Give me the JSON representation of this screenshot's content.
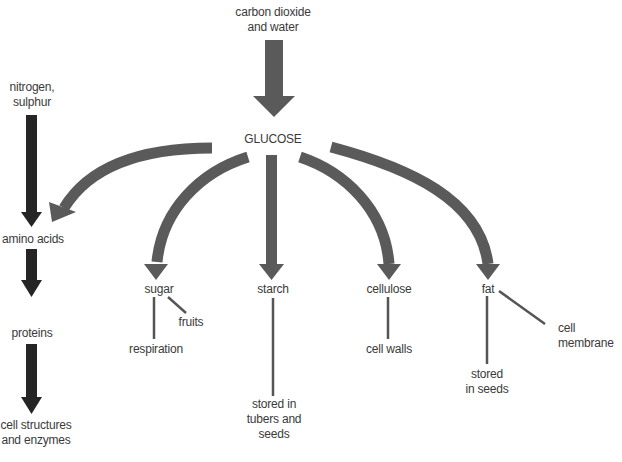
{
  "diagram": {
    "colors": {
      "background": "#ffffff",
      "grey_arrow": "#5a5a5a",
      "dark_arrow": "#252525",
      "line": "#555555",
      "text": "#3a3a3a"
    },
    "nodes": {
      "source": {
        "line1": "carbon dioxide",
        "line2": "and water"
      },
      "glucose": {
        "label": "GLUCOSE"
      },
      "minerals": {
        "line1": "nitrogen,",
        "line2": "sulphur"
      },
      "amino_acids": {
        "label": "amino acids"
      },
      "proteins": {
        "label": "proteins"
      },
      "cell_structures": {
        "line1": "cell structures",
        "line2": "and enzymes"
      },
      "sugar": {
        "label": "sugar"
      },
      "fruits": {
        "label": "fruits"
      },
      "respiration": {
        "label": "respiration"
      },
      "starch": {
        "label": "starch"
      },
      "starch_store": {
        "line1": "stored in",
        "line2": "tubers and",
        "line3": "seeds"
      },
      "cellulose": {
        "label": "cellulose"
      },
      "cell_walls": {
        "label": "cell walls"
      },
      "fat": {
        "label": "fat"
      },
      "fat_store": {
        "line1": "stored",
        "line2": "in seeds"
      },
      "cell_membrane": {
        "line1": "cell",
        "line2": "membrane"
      }
    },
    "edges": [
      {
        "from": "carbon dioxide and water",
        "to": "GLUCOSE",
        "style": "grey-arrow"
      },
      {
        "from": "GLUCOSE",
        "to": "amino acids",
        "style": "grey-curved-arrow"
      },
      {
        "from": "GLUCOSE",
        "to": "sugar",
        "style": "grey-curved-arrow"
      },
      {
        "from": "GLUCOSE",
        "to": "starch",
        "style": "grey-arrow"
      },
      {
        "from": "GLUCOSE",
        "to": "cellulose",
        "style": "grey-curved-arrow"
      },
      {
        "from": "GLUCOSE",
        "to": "fat",
        "style": "grey-curved-arrow"
      },
      {
        "from": "nitrogen, sulphur",
        "to": "amino acids",
        "style": "dark-arrow"
      },
      {
        "from": "amino acids",
        "to": "proteins",
        "style": "dark-arrow"
      },
      {
        "from": "proteins",
        "to": "cell structures and enzymes",
        "style": "dark-arrow"
      },
      {
        "from": "sugar",
        "to": "respiration",
        "style": "line"
      },
      {
        "from": "sugar",
        "to": "fruits",
        "style": "line"
      },
      {
        "from": "starch",
        "to": "stored in tubers and seeds",
        "style": "line"
      },
      {
        "from": "cellulose",
        "to": "cell walls",
        "style": "line"
      },
      {
        "from": "fat",
        "to": "stored in seeds",
        "style": "line"
      },
      {
        "from": "fat",
        "to": "cell membrane",
        "style": "line"
      }
    ]
  }
}
